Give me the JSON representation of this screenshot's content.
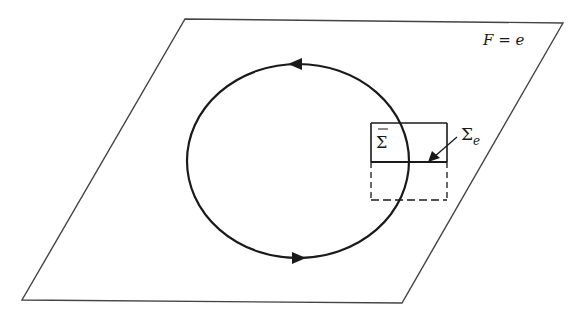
{
  "diagram": {
    "plane_label": "F = e",
    "sigma_bar_label": "Σ̄",
    "sigma_e_label_main": "Σ",
    "sigma_e_label_sub": "e",
    "colors": {
      "stroke": "#1a1a1a",
      "plane_stroke": "#444444",
      "background": "#ffffff"
    },
    "plane": {
      "corners": [
        [
          185,
          19
        ],
        [
          563,
          23
        ],
        [
          402,
          303
        ],
        [
          22,
          300
        ]
      ]
    },
    "loop": {
      "center": [
        298,
        161
      ],
      "rx": 111,
      "ry": 97,
      "arrows": [
        {
          "position": "top",
          "direction": "left"
        },
        {
          "position": "bottom",
          "direction": "right"
        }
      ]
    },
    "box": {
      "x": 371,
      "y_top": 123,
      "y_mid": 162,
      "y_bottom": 200,
      "width": 76,
      "upper_solid": true,
      "lower_dashed": true
    }
  }
}
